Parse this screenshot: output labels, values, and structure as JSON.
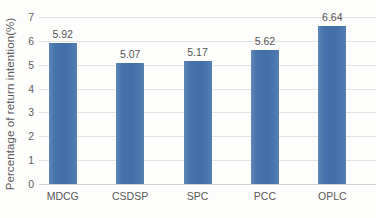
{
  "chart_data": {
    "type": "bar",
    "title": "",
    "xlabel": "",
    "ylabel": "Percentage of return intention(%)",
    "categories": [
      "MDCG",
      "CSDSP",
      "SPC",
      "PCC",
      "OPLC"
    ],
    "values": [
      5.92,
      5.07,
      5.17,
      5.62,
      6.64
    ],
    "value_labels": [
      "5.92",
      "5.07",
      "5.17",
      "5.62",
      "6.64"
    ],
    "ylim": [
      0,
      7
    ],
    "yticks": [
      0,
      1,
      2,
      3,
      4,
      5,
      6,
      7
    ],
    "ytick_labels": [
      "0",
      "1",
      "2",
      "3",
      "4",
      "5",
      "6",
      "7"
    ],
    "grid": true,
    "legend": false,
    "legend_position": "none",
    "series": [
      {
        "name": "Percentage of return intention(%)",
        "values": [
          5.92,
          5.07,
          5.17,
          5.62,
          6.64
        ],
        "color": "#4472a8"
      }
    ]
  },
  "style": {
    "bar_color": "#4472a8",
    "gridline_color": "#e2e2e2",
    "axis_text_color": "#5c5c5c",
    "background": "#fdfdfc"
  }
}
